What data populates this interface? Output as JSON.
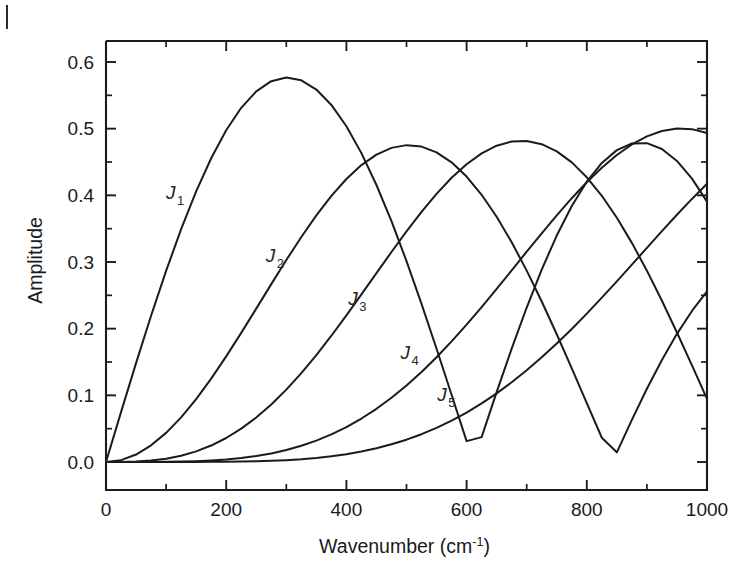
{
  "figure": {
    "name": "bessel-function-amplitude-plot",
    "background_color": "#ffffff",
    "line_color": "#1b1b1b",
    "margin_mark": "page-edge-tick"
  },
  "chart_data": {
    "type": "line",
    "title": "",
    "subtitle": "",
    "xlabel": "Wavenumber (cm",
    "xlabel_superscript": "-1",
    "xlabel_suffix": ")",
    "ylabel": "Amplitude",
    "xlim": [
      0,
      1000
    ],
    "ylim": [
      0.0,
      0.65
    ],
    "xticks": [
      0,
      200,
      400,
      600,
      800,
      1000
    ],
    "xtick_labels": [
      "0",
      "200",
      "400",
      "600",
      "800",
      "1000"
    ],
    "xminor_interval": 100,
    "yticks": [
      0.0,
      0.1,
      0.2,
      0.3,
      0.4,
      0.5,
      0.6
    ],
    "ytick_labels": [
      "0.0",
      "0.1",
      "0.2",
      "0.3",
      "0.4",
      "0.5",
      "0.6"
    ],
    "yminor_interval": 0.05,
    "grid": false,
    "legend_position": "inline-curve-labels",
    "annotations": [
      {
        "text": "J",
        "subscript": "1",
        "x": 100,
        "y": 0.395
      },
      {
        "text": "J",
        "subscript": "2",
        "x": 266,
        "y": 0.3
      },
      {
        "text": "J",
        "subscript": "3",
        "x": 403,
        "y": 0.236
      },
      {
        "text": "J",
        "subscript": "4",
        "x": 490,
        "y": 0.154
      },
      {
        "text": "J",
        "subscript": "5",
        "x": 551,
        "y": 0.091
      }
    ],
    "series": [
      {
        "name": "J1",
        "label": "J₁",
        "peak": {
          "x": 307,
          "y": 0.582
        },
        "zero": {
          "x": 649,
          "y": 0.0
        },
        "end": {
          "x": 1000,
          "y": 0.277
        },
        "x": [
          0,
          25,
          50,
          75,
          100,
          125,
          150,
          175,
          200,
          225,
          250,
          275,
          300,
          325,
          350,
          375,
          400,
          425,
          450,
          475,
          500,
          525,
          550,
          575,
          600,
          625,
          650,
          675,
          700,
          725,
          750,
          775,
          800,
          825,
          850,
          875,
          900,
          925,
          950,
          975,
          1000
        ],
        "y": [
          0.0,
          0.0748,
          0.1483,
          0.2194,
          0.2867,
          0.3492,
          0.4059,
          0.4556,
          0.4977,
          0.5313,
          0.556,
          0.5712,
          0.5767,
          0.5725,
          0.5587,
          0.5356,
          0.5036,
          0.4633,
          0.4155,
          0.3612,
          0.3014,
          0.2372,
          0.1699,
          0.1008,
          0.0313,
          0.0373,
          0.1048,
          0.17,
          0.2317,
          0.2886,
          0.3397,
          0.384,
          0.4205,
          0.4486,
          0.4678,
          0.4777,
          0.4783,
          0.4695,
          0.4516,
          0.4251,
          0.3906
        ]
      },
      {
        "name": "J2",
        "label": "J₂",
        "peak": {
          "x": 519,
          "y": 0.4865
        },
        "zero": {
          "x": 867,
          "y": 0.0
        },
        "end": {
          "x": 1000,
          "y": 0.243
        },
        "x": [
          0,
          25,
          50,
          75,
          100,
          125,
          150,
          175,
          200,
          225,
          250,
          275,
          300,
          325,
          350,
          375,
          400,
          425,
          450,
          475,
          500,
          525,
          550,
          575,
          600,
          625,
          650,
          675,
          700,
          725,
          750,
          775,
          800,
          825,
          850,
          875,
          900,
          925,
          950,
          975,
          1000
        ],
        "y": [
          0.0,
          0.0028,
          0.0112,
          0.025,
          0.0437,
          0.067,
          0.0943,
          0.125,
          0.1584,
          0.1937,
          0.2301,
          0.2668,
          0.3029,
          0.3375,
          0.3699,
          0.3991,
          0.4245,
          0.4454,
          0.4611,
          0.4712,
          0.4753,
          0.4731,
          0.4645,
          0.4495,
          0.4282,
          0.4008,
          0.3678,
          0.3297,
          0.2871,
          0.2408,
          0.1916,
          0.1405,
          0.0884,
          0.0364,
          0.0145,
          0.0633,
          0.1098,
          0.153,
          0.1922,
          0.2266,
          0.2559
        ]
      },
      {
        "name": "J3",
        "label": "J₃",
        "peak": {
          "x": 705,
          "y": 0.4345
        },
        "end": {
          "x": 1000,
          "y": 0.115
        },
        "x": [
          0,
          25,
          50,
          75,
          100,
          125,
          150,
          175,
          200,
          225,
          250,
          275,
          300,
          325,
          350,
          375,
          400,
          425,
          450,
          475,
          500,
          525,
          550,
          575,
          600,
          625,
          650,
          675,
          700,
          725,
          750,
          775,
          800,
          825,
          850,
          875,
          900,
          925,
          950,
          975,
          1000
        ],
        "y": [
          0.0,
          0.0001,
          0.0006,
          0.0021,
          0.0049,
          0.0094,
          0.0159,
          0.0247,
          0.036,
          0.05,
          0.0668,
          0.0863,
          0.1086,
          0.1334,
          0.1604,
          0.1894,
          0.2199,
          0.2514,
          0.2833,
          0.315,
          0.3459,
          0.3752,
          0.4022,
          0.4263,
          0.4467,
          0.4629,
          0.4744,
          0.4807,
          0.4816,
          0.4767,
          0.466,
          0.4494,
          0.4271,
          0.3993,
          0.3663,
          0.3287,
          0.287,
          0.2419,
          0.1943,
          0.145,
          0.0948
        ]
      },
      {
        "name": "J4",
        "label": "J₄",
        "peak": {
          "x": 888,
          "y": 0.4055
        },
        "end": {
          "x": 1000,
          "y": 0.358
        },
        "x": [
          0,
          25,
          50,
          75,
          100,
          125,
          150,
          175,
          200,
          225,
          250,
          275,
          300,
          325,
          350,
          375,
          400,
          425,
          450,
          475,
          500,
          525,
          550,
          575,
          600,
          625,
          650,
          675,
          700,
          725,
          750,
          775,
          800,
          825,
          850,
          875,
          900,
          925,
          950,
          975,
          1000
        ],
        "y": [
          0.0,
          0.0,
          0.0,
          0.0001,
          0.0002,
          0.0006,
          0.0012,
          0.0022,
          0.0037,
          0.0059,
          0.0089,
          0.0129,
          0.018,
          0.0243,
          0.0321,
          0.0414,
          0.0524,
          0.0652,
          0.0798,
          0.0963,
          0.1148,
          0.1351,
          0.1572,
          0.1809,
          0.206,
          0.2324,
          0.2596,
          0.2874,
          0.3154,
          0.3431,
          0.37,
          0.3957,
          0.4197,
          0.4415,
          0.4605,
          0.4763,
          0.4884,
          0.4965,
          0.5002,
          0.4993,
          0.4934
        ]
      },
      {
        "name": "J5",
        "label": "J₅",
        "peak": {
          "x": 1000,
          "y": 0.362
        },
        "end": {
          "x": 1000,
          "y": 0.362
        },
        "x": [
          0,
          25,
          50,
          75,
          100,
          125,
          150,
          175,
          200,
          225,
          250,
          275,
          300,
          325,
          350,
          375,
          400,
          425,
          450,
          475,
          500,
          525,
          550,
          575,
          600,
          625,
          650,
          675,
          700,
          725,
          750,
          775,
          800,
          825,
          850,
          875,
          900,
          925,
          950,
          975,
          1000
        ],
        "y": [
          0.0,
          0.0,
          0.0,
          0.0,
          0.0,
          0.0,
          0.0001,
          0.0002,
          0.0003,
          0.0006,
          0.001,
          0.0017,
          0.0027,
          0.0041,
          0.006,
          0.0085,
          0.0117,
          0.0157,
          0.0206,
          0.0265,
          0.0335,
          0.0417,
          0.0512,
          0.062,
          0.0742,
          0.0879,
          0.103,
          0.1196,
          0.1376,
          0.157,
          0.1777,
          0.1996,
          0.2226,
          0.2465,
          0.271,
          0.296,
          0.3212,
          0.3462,
          0.3708,
          0.3946,
          0.4173
        ]
      }
    ]
  }
}
